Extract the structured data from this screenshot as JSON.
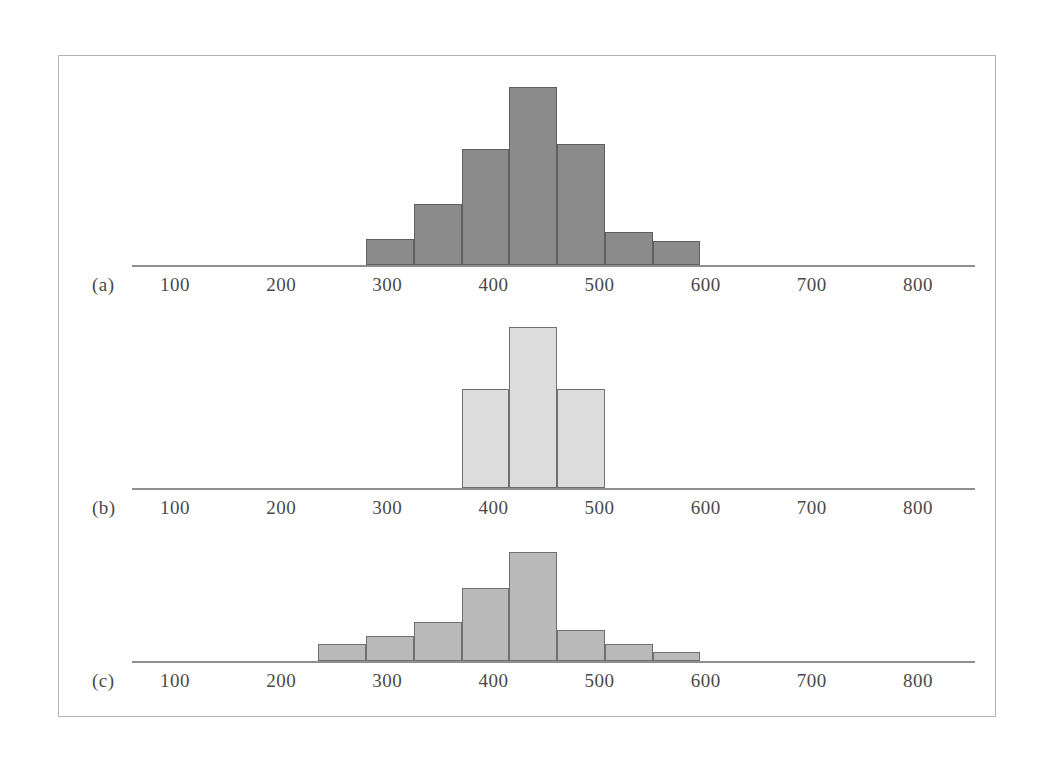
{
  "figure": {
    "background_color": "#ffffff",
    "frame_color": "#b3b3b3",
    "axis_color": "#8e8e8e",
    "tick_text_color": "#4a4a4a"
  },
  "axis": {
    "tick_labels": [
      "100",
      "200",
      "300",
      "400",
      "500",
      "600",
      "700",
      "800"
    ],
    "tick_values": [
      100,
      200,
      300,
      400,
      500,
      600,
      700,
      800
    ]
  },
  "panels": [
    {
      "label": "(a)"
    },
    {
      "label": "(b)"
    },
    {
      "label": "(c)"
    }
  ],
  "chart_data": [
    {
      "type": "bar",
      "title": "(a)",
      "panel": "a",
      "xlabel": "",
      "ylabel": "",
      "xlim": [
        0,
        880
      ],
      "grid": false,
      "legend": null,
      "bar_color": "#8b8b8b",
      "bar_edge_color": "#5f5f5f",
      "bin_width": 45,
      "bin_edges": [
        280,
        325,
        370,
        415,
        460,
        505,
        550,
        595,
        640
      ],
      "bin_centers": [
        302,
        347,
        392,
        437,
        482,
        527,
        572,
        617
      ],
      "values": [
        26,
        61,
        116,
        178,
        121,
        33,
        24
      ],
      "bars": [
        {
          "x_start": 280,
          "x_end": 325,
          "height": 26
        },
        {
          "x_start": 325,
          "x_end": 370,
          "height": 61
        },
        {
          "x_start": 370,
          "x_end": 415,
          "height": 116
        },
        {
          "x_start": 415,
          "x_end": 460,
          "height": 178
        },
        {
          "x_start": 460,
          "x_end": 505,
          "height": 121
        },
        {
          "x_start": 505,
          "x_end": 550,
          "height": 33
        },
        {
          "x_start": 550,
          "x_end": 595,
          "height": 24
        }
      ]
    },
    {
      "type": "bar",
      "title": "(b)",
      "panel": "b",
      "xlabel": "",
      "ylabel": "",
      "xlim": [
        0,
        880
      ],
      "grid": false,
      "legend": null,
      "bar_color": "#dcdcdc",
      "bar_edge_color": "#6f6f6f",
      "bin_width": 45,
      "bin_edges": [
        370,
        415,
        460,
        505
      ],
      "bin_centers": [
        392,
        437,
        482
      ],
      "values": [
        99,
        161,
        99
      ],
      "bars": [
        {
          "x_start": 370,
          "x_end": 415,
          "height": 99
        },
        {
          "x_start": 415,
          "x_end": 460,
          "height": 161
        },
        {
          "x_start": 460,
          "x_end": 505,
          "height": 99
        }
      ]
    },
    {
      "type": "bar",
      "title": "(c)",
      "panel": "c",
      "xlabel": "",
      "ylabel": "",
      "xlim": [
        0,
        880
      ],
      "grid": false,
      "legend": null,
      "bar_color": "#b9b9b9",
      "bar_edge_color": "#6f6f6f",
      "bin_width": 45,
      "bin_edges": [
        235,
        280,
        325,
        370,
        415,
        460,
        505,
        550,
        595
      ],
      "bin_centers": [
        257,
        302,
        347,
        392,
        437,
        482,
        527,
        572
      ],
      "values": [
        17,
        25,
        39,
        73,
        109,
        31,
        17,
        9
      ],
      "bars": [
        {
          "x_start": 235,
          "x_end": 280,
          "height": 17
        },
        {
          "x_start": 280,
          "x_end": 325,
          "height": 25
        },
        {
          "x_start": 325,
          "x_end": 370,
          "height": 39
        },
        {
          "x_start": 370,
          "x_end": 415,
          "height": 73
        },
        {
          "x_start": 415,
          "x_end": 460,
          "height": 109
        },
        {
          "x_start": 460,
          "x_end": 505,
          "height": 31
        },
        {
          "x_start": 505,
          "x_end": 550,
          "height": 17
        },
        {
          "x_start": 550,
          "x_end": 595,
          "height": 9
        }
      ]
    }
  ]
}
